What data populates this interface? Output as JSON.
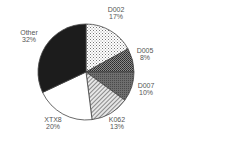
{
  "chart_data": {
    "type": "pie",
    "title": "",
    "start_angle": "12 o'clock",
    "direction": "clockwise",
    "slices": [
      {
        "label": "D002",
        "value": 17,
        "pct_label": "17%",
        "pattern": "dots",
        "fill": "#ffffff",
        "ink": "#555555"
      },
      {
        "label": "D005",
        "value": 8,
        "pct_label": "8%",
        "pattern": "crosshatch-dark",
        "fill": "#777777",
        "ink": "#222222"
      },
      {
        "label": "D007",
        "value": 10,
        "pct_label": "10%",
        "pattern": "solid-gray",
        "fill": "#666666",
        "ink": "#444444"
      },
      {
        "label": "K062",
        "value": 13,
        "pct_label": "13%",
        "pattern": "diagonal-light",
        "fill": "#dddddd",
        "ink": "#777777"
      },
      {
        "label": "XTX8",
        "value": 20,
        "pct_label": "20%",
        "pattern": "none",
        "fill": "#ffffff",
        "ink": "#ffffff"
      },
      {
        "label": "Other",
        "value": 32,
        "pct_label": "32%",
        "pattern": "solid-black",
        "fill": "#1a1a1a",
        "ink": "#1a1a1a"
      }
    ],
    "legend": "none (labels placed outside slices)"
  },
  "labels": {
    "d002": {
      "name": "D002",
      "pct": "17%"
    },
    "d005": {
      "name": "D005",
      "pct": "8%"
    },
    "d007": {
      "name": "D007",
      "pct": "10%"
    },
    "k062": {
      "name": "K062",
      "pct": "13%"
    },
    "xtx8": {
      "name": "XTX8",
      "pct": "20%"
    },
    "other": {
      "name": "Other",
      "pct": "32%"
    }
  }
}
